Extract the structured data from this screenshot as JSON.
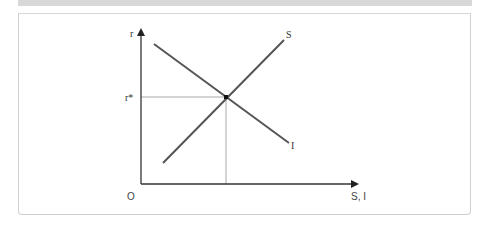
{
  "diagram": {
    "axes": {
      "y_label": "r",
      "x_label": "S, I",
      "origin_label": "O"
    },
    "curves": [
      {
        "name": "S",
        "label": "S",
        "slope": "upward",
        "color": "#555555"
      },
      {
        "name": "I",
        "label": "I",
        "slope": "downward",
        "color": "#555555"
      }
    ],
    "equilibrium": {
      "y_label": "r*"
    },
    "colors": {
      "axis": "#333333",
      "curve": "#555555",
      "guide": "#999999",
      "frame": "#cfcfcf",
      "topbar": "#d8d8d8"
    }
  }
}
